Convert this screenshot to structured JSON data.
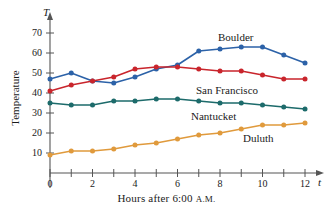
{
  "chart_data": {
    "type": "line",
    "title": "",
    "xlabel": "Hours after 6:00 A.M.",
    "ylabel": "Temperature",
    "x_axis_symbol": "t",
    "y_axis_symbol": "T",
    "x": [
      0,
      1,
      2,
      3,
      4,
      5,
      6,
      7,
      8,
      9,
      10,
      11,
      12
    ],
    "xlim": [
      0,
      12
    ],
    "ylim": [
      0,
      75
    ],
    "xticks": [
      0,
      1,
      2,
      3,
      4,
      5,
      6,
      7,
      8,
      9,
      10,
      11,
      12
    ],
    "xtick_labels": [
      "0",
      "",
      "2",
      "",
      "4",
      "",
      "6",
      "",
      "8",
      "",
      "10",
      "",
      "12"
    ],
    "yticks": [
      10,
      20,
      30,
      40,
      50,
      60,
      70
    ],
    "ytick_labels": [
      "10",
      "20",
      "30",
      "40",
      "50",
      "60",
      "70"
    ],
    "grid": false,
    "legend_position": "inline-annotations",
    "series": [
      {
        "name": "Boulder",
        "color": "#2c62a8",
        "values": [
          47,
          50,
          46,
          45,
          48,
          52,
          54,
          61,
          62,
          63,
          63,
          59,
          55
        ],
        "annotation": "Boulder"
      },
      {
        "name": "San Francisco",
        "color": "#c9252c",
        "values": [
          41,
          44,
          46,
          48,
          52,
          53,
          53,
          52,
          51,
          51,
          49,
          47,
          47
        ],
        "annotation": "San Francisco"
      },
      {
        "name": "Nantucket",
        "color": "#1d6b6b",
        "values": [
          35,
          34,
          34,
          36,
          36,
          37,
          37,
          36,
          35,
          35,
          34,
          33,
          32
        ],
        "annotation": "Nantucket"
      },
      {
        "name": "Duluth",
        "color": "#e09a3c",
        "values": [
          9,
          11,
          11,
          12,
          14,
          15,
          17,
          19,
          20,
          22,
          24,
          24,
          25
        ],
        "annotation": "Duluth"
      }
    ],
    "annotations": [
      {
        "label": "Boulder",
        "x_px": 218,
        "y_px": 31
      },
      {
        "label": "San Francisco",
        "x_px": 196,
        "y_px": 84
      },
      {
        "label": "Nantucket",
        "x_px": 191,
        "y_px": 110
      },
      {
        "label": "Duluth",
        "x_px": 243,
        "y_px": 132
      }
    ]
  },
  "axis_labels": {
    "y_title": "Temperature",
    "x_title_main": "Hours after 6:00 ",
    "x_title_ampm": "A.M.",
    "y_symbol": "T",
    "x_symbol": "t"
  }
}
